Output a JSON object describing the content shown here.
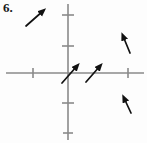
{
  "figure": {
    "label": "6.",
    "type": "vector-field-diagram",
    "width": 147,
    "height": 143,
    "background_color": "#fdfdfd",
    "axis_color": "#8a8a8a",
    "arrow_color": "#111111",
    "label_color": "#1a1a1a"
  },
  "axes": {
    "origin": {
      "x": 68,
      "y": 73
    },
    "x_axis": {
      "x1": 6,
      "y1": 73,
      "x2": 144,
      "y2": 73
    },
    "y_axis": {
      "x1": 68,
      "y1": 4,
      "x2": 68,
      "y2": 140
    },
    "x_ticks": [
      {
        "x": 33,
        "half_length": 5
      },
      {
        "x": 128,
        "half_length": 5
      }
    ],
    "y_ticks": [
      {
        "y": 15,
        "half_length": 6
      },
      {
        "y": 46,
        "half_length": 6
      },
      {
        "y": 103,
        "half_length": 6
      },
      {
        "y": 133,
        "half_length": 5
      }
    ]
  },
  "arrows": [
    {
      "name": "arrow-upper-left",
      "x1": 26,
      "y1": 26,
      "x2": 43,
      "y2": 11,
      "direction": "up-right",
      "angle_deg": 41
    },
    {
      "name": "arrow-origin",
      "x1": 62,
      "y1": 83,
      "x2": 77,
      "y2": 66,
      "direction": "up-right",
      "angle_deg": 49
    },
    {
      "name": "arrow-right-of-origin",
      "x1": 86,
      "y1": 82,
      "x2": 100,
      "y2": 66,
      "direction": "up-right",
      "angle_deg": 49
    },
    {
      "name": "arrow-upper-right",
      "x1": 130,
      "y1": 53,
      "x2": 123,
      "y2": 36,
      "direction": "up-slightly-left",
      "angle_deg": 68
    },
    {
      "name": "arrow-lower-right",
      "x1": 131,
      "y1": 113,
      "x2": 124,
      "y2": 98,
      "direction": "up-slightly-left",
      "angle_deg": 65
    }
  ]
}
